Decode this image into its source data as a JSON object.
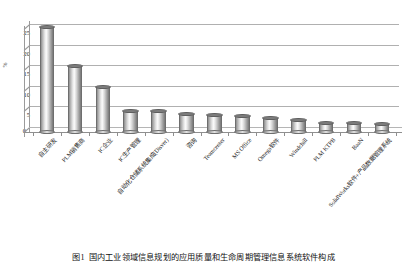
{
  "chart_data": {
    "type": "bar",
    "title": "",
    "xlabel": "",
    "ylabel": "%",
    "ylim": [
      0,
      27
    ],
    "yticks": [
      0,
      5,
      10,
      15,
      20,
      25
    ],
    "grid": true,
    "legend": false,
    "style": "3d-cylinder",
    "categories": [
      "自主研发",
      "PLM销售商",
      "IC企业",
      "IC生产管理",
      "自动化仓储系统集成(Disver)",
      "咨询",
      "Teamcenter",
      "MS Office",
      "Omega软件",
      "Windchill",
      "PLM KTPB",
      "BaaN",
      "SolidWorks软件+产品数据管理系统"
    ],
    "values": [
      25.5,
      16.0,
      11.0,
      5.0,
      5.0,
      4.3,
      4.2,
      3.8,
      3.5,
      3.0,
      2.2,
      2.2,
      2.0
    ],
    "bar_color": "#b0b0b0",
    "grid_color": "#b0b0b0",
    "axis_color": "#8f8f8f"
  },
  "caption": {
    "label": "图1",
    "text": "国内工业领域信息规划的应用质量和生命周期管理信息系统软件构成"
  }
}
